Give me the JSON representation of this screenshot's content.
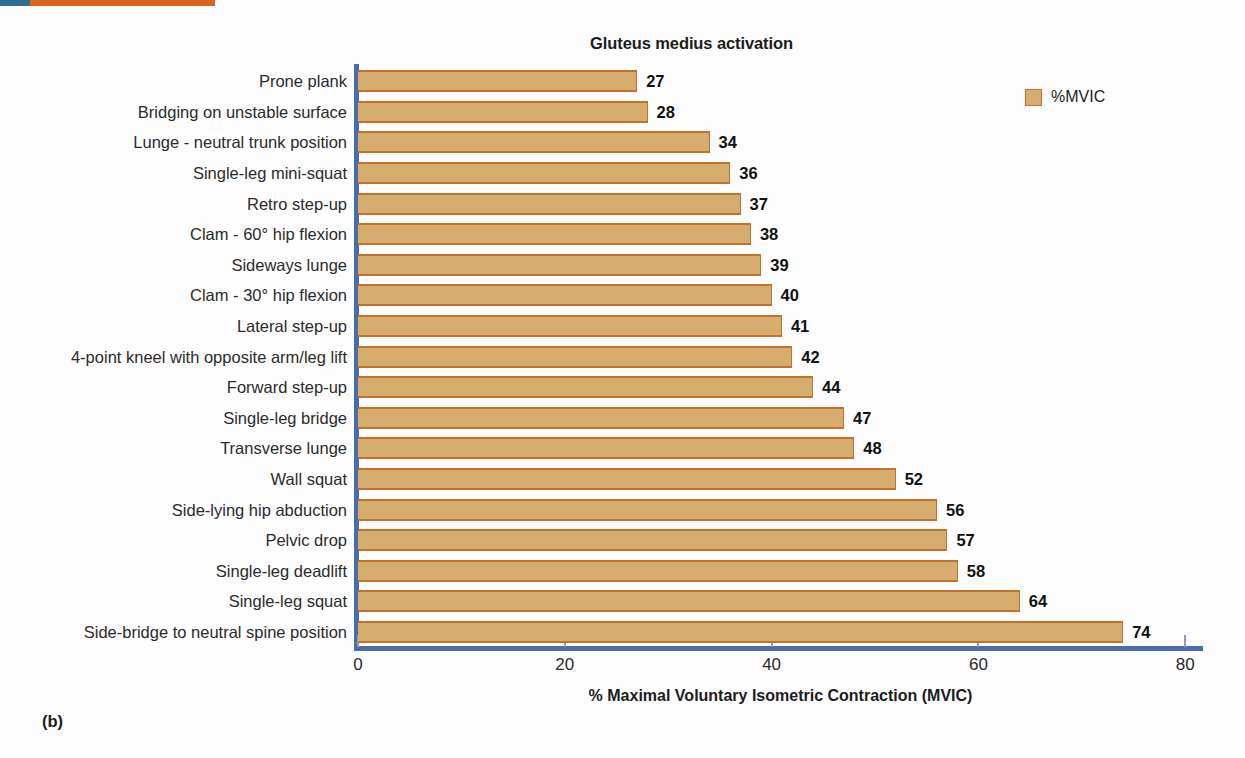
{
  "figure": {
    "panel_caption": "(b)",
    "accent_blue": "#2c6e94",
    "accent_orange": "#d9661f",
    "axis_color": "#4a6fa8"
  },
  "legend": {
    "position": "top-right",
    "entries": [
      {
        "label": "%MVIC",
        "fill": "#d6ad6e",
        "stroke": "#c1732b"
      }
    ]
  },
  "chart_data": {
    "type": "bar",
    "orientation": "horizontal",
    "title": "Gluteus medius activation",
    "xlabel": "% Maximal Voluntary Isometric Contraction (MVIC)",
    "ylabel": "",
    "xlim": [
      0,
      80
    ],
    "xticks": [
      0,
      20,
      40,
      60,
      80
    ],
    "xticklabels": [
      "0",
      "20",
      "40",
      "60",
      "80"
    ],
    "grid": false,
    "legend": [
      "%MVIC"
    ],
    "series_name": "%MVIC",
    "bar_fill": "#d6ad6e",
    "bar_stroke": "#c1732b",
    "data_labels": true,
    "categories": [
      "Prone plank",
      "Bridging on unstable surface",
      "Lunge - neutral trunk position",
      "Single-leg mini-squat",
      "Retro step-up",
      "Clam - 60° hip flexion",
      "Sideways lunge",
      "Clam - 30° hip flexion",
      "Lateral step-up",
      "4-point kneel with opposite arm/leg lift",
      "Forward step-up",
      "Single-leg bridge",
      "Transverse lunge",
      "Wall squat",
      "Side-lying hip abduction",
      "Pelvic drop",
      "Single-leg deadlift",
      "Single-leg squat",
      "Side-bridge to neutral spine position"
    ],
    "values": [
      27,
      28,
      34,
      36,
      37,
      38,
      39,
      40,
      41,
      42,
      44,
      47,
      48,
      52,
      56,
      57,
      58,
      64,
      74
    ]
  }
}
